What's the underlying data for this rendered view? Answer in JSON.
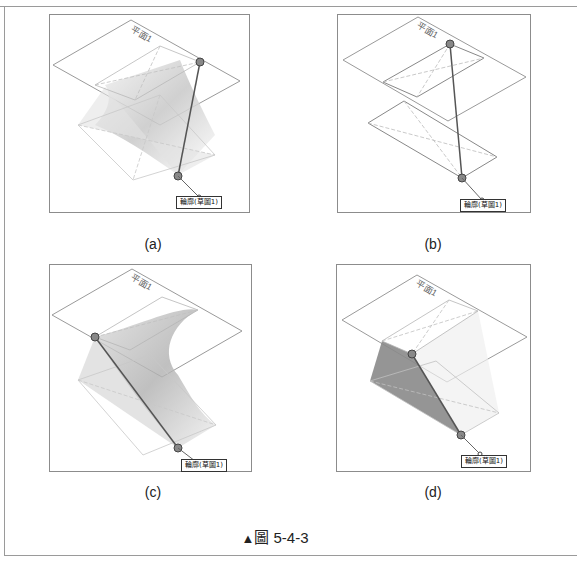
{
  "figure": {
    "caption_marker": "▲",
    "caption_text": "圖 5-4-3",
    "panels": [
      {
        "id": "a",
        "label": "(a)",
        "plane_tag": "平面1",
        "profile_tag": "輪廓(草圖1)",
        "description": "twisted loft surface between two rectangular profiles; guide line from upper-right corner to lower point"
      },
      {
        "id": "b",
        "label": "(b)",
        "plane_tag": "平面1",
        "profile_tag": "輪廓(草圖1)",
        "description": "two rectangular sketches on parallel planes connected by a guide line, no surface"
      },
      {
        "id": "c",
        "label": "(c)",
        "plane_tag": "平面1",
        "profile_tag": "輪廓(草圖1)",
        "description": "curved loft surface with guide line from upper-left corner"
      },
      {
        "id": "d",
        "label": "(d)",
        "plane_tag": "平面1",
        "profile_tag": "輪廓(草圖1)",
        "description": "flat shaded planar face between profiles with guide line"
      }
    ]
  },
  "colors": {
    "frame": "#9a9a9a",
    "panel_border": "#8c8c8c",
    "sketch_line": "#9a9a9a",
    "guide_line": "#555555",
    "surface_shade": "#8a8a8a"
  }
}
